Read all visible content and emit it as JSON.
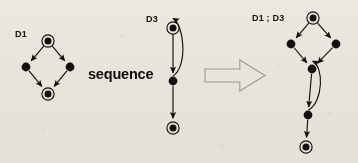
{
  "figure": {
    "type": "diagram",
    "background_color": "#f4f2ee",
    "ink_color": "#111111",
    "operator_label": "sequence"
  },
  "panels": [
    {
      "id": "d1",
      "label": "D1",
      "label_x": 15,
      "label_y": 29,
      "nodes": [
        {
          "id": "d1-start",
          "kind": "double-circle",
          "cx": 48,
          "cy": 41
        },
        {
          "id": "d1-left",
          "kind": "filled-dot",
          "cx": 26,
          "cy": 67
        },
        {
          "id": "d1-right",
          "kind": "filled-dot",
          "cx": 70,
          "cy": 67
        },
        {
          "id": "d1-end",
          "kind": "double-circle",
          "cx": 48,
          "cy": 94
        }
      ],
      "edges": [
        {
          "from": "d1-start",
          "to": "d1-left"
        },
        {
          "from": "d1-start",
          "to": "d1-right"
        },
        {
          "from": "d1-left",
          "to": "d1-end"
        },
        {
          "from": "d1-right",
          "to": "d1-end"
        }
      ]
    },
    {
      "id": "d3",
      "label": "D3",
      "label_x": 146,
      "label_y": 14,
      "nodes": [
        {
          "id": "d3-start",
          "kind": "double-circle",
          "cx": 173,
          "cy": 28
        },
        {
          "id": "d3-mid",
          "kind": "filled-dot",
          "cx": 173,
          "cy": 81
        },
        {
          "id": "d3-end",
          "kind": "double-circle",
          "cx": 173,
          "cy": 128
        }
      ],
      "edges": [
        {
          "from": "d3-start",
          "to": "d3-mid",
          "style": "straight"
        },
        {
          "from": "d3-mid",
          "to": "d3-end",
          "style": "straight"
        },
        {
          "from": "d3-mid",
          "to": "d3-start",
          "style": "curved-back"
        }
      ]
    },
    {
      "id": "d1d3",
      "label": "D1 ; D3",
      "label_x": 252,
      "label_y": 13,
      "nodes": [
        {
          "id": "c-start",
          "kind": "double-circle",
          "cx": 313,
          "cy": 18
        },
        {
          "id": "c-left",
          "kind": "filled-dot",
          "cx": 291,
          "cy": 44
        },
        {
          "id": "c-right",
          "kind": "filled-dot",
          "cx": 336,
          "cy": 44
        },
        {
          "id": "c-join",
          "kind": "filled-dot",
          "cx": 312,
          "cy": 69
        },
        {
          "id": "c-mid",
          "kind": "filled-dot",
          "cx": 308,
          "cy": 115
        },
        {
          "id": "c-end",
          "kind": "double-circle",
          "cx": 306,
          "cy": 147
        }
      ],
      "edges": [
        {
          "from": "c-start",
          "to": "c-left",
          "style": "straight"
        },
        {
          "from": "c-start",
          "to": "c-right",
          "style": "straight"
        },
        {
          "from": "c-left",
          "to": "c-join",
          "style": "straight"
        },
        {
          "from": "c-right",
          "to": "c-join",
          "style": "straight"
        },
        {
          "from": "c-join",
          "to": "c-mid",
          "style": "straight"
        },
        {
          "from": "c-mid",
          "to": "c-end",
          "style": "straight"
        },
        {
          "from": "c-mid",
          "to": "c-join",
          "style": "curved-back"
        }
      ]
    }
  ],
  "big_arrow": {
    "name": "implies-arrow",
    "direction": "right",
    "x": 205,
    "y": 60,
    "width": 60,
    "height": 31,
    "fill": "none",
    "stroke": "#9a9894"
  }
}
